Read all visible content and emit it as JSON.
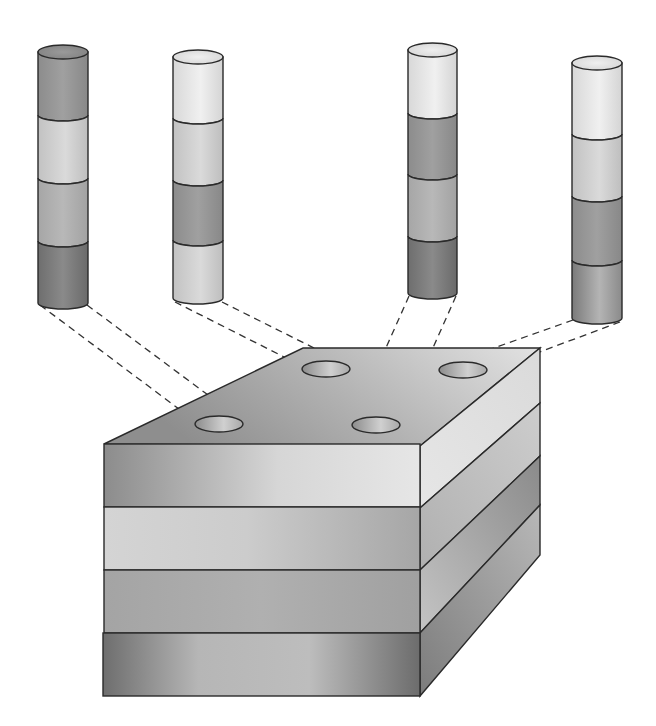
{
  "diagram": {
    "title": "",
    "colors": {
      "background": "#ffffff",
      "outline": "#2a2a2a",
      "dark": "#7d7d7d",
      "medium": "#a8a8a8",
      "light": "#c9c9c9",
      "lightest": "#e3e3e3"
    },
    "cores": [
      {
        "id": "core-1",
        "cx": 63,
        "top": 52,
        "bottom": 303,
        "w": 50,
        "bands": [
          "medium-dark",
          "light",
          "medium-light",
          "dark"
        ]
      },
      {
        "id": "core-2",
        "cx": 198,
        "top": 57,
        "bottom": 298,
        "w": 50,
        "bands": [
          "lightest",
          "light",
          "medium-dark",
          "light"
        ]
      },
      {
        "id": "core-3",
        "cx": 432,
        "top": 50,
        "bottom": 293,
        "w": 49,
        "bands": [
          "lightest",
          "medium-dark",
          "medium",
          "dark"
        ]
      },
      {
        "id": "core-4",
        "cx": 597,
        "top": 63,
        "bottom": 318,
        "w": 50,
        "bands": [
          "lightest",
          "light",
          "medium-dark",
          "medium-dark-gradient"
        ]
      }
    ],
    "block": {
      "strata": [
        "top-layer",
        "second-layer",
        "third-layer",
        "bottom-layer"
      ],
      "holes": [
        {
          "id": "hole-1",
          "cx": 219,
          "cy": 424
        },
        {
          "id": "hole-2",
          "cx": 326,
          "cy": 369
        },
        {
          "id": "hole-3",
          "cx": 376,
          "cy": 425
        },
        {
          "id": "hole-4",
          "cx": 463,
          "cy": 370
        }
      ]
    },
    "labels": []
  }
}
